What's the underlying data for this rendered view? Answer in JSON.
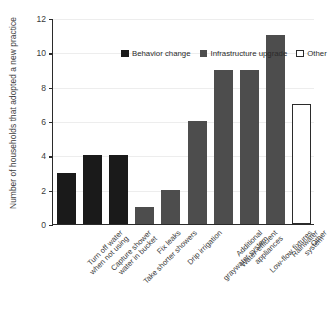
{
  "chart_data": {
    "type": "bar",
    "title": "",
    "xlabel": "",
    "ylabel": "Number of households that\nadopted a new practice",
    "ylim": [
      0,
      12
    ],
    "yticks": [
      0,
      2,
      4,
      6,
      8,
      10,
      12
    ],
    "grid": true,
    "legend_position": "upper left (inside axes)",
    "categories": [
      "Turn off water\nwhen not using",
      "Capture shower\nwater in bucket",
      "Take shorter showers",
      "Fix leaks",
      "Drip irrigation",
      "Additional\ngraywater system",
      "Water-efficient\nappliances",
      "Low-flow fixtures",
      "Rainwater system",
      "Other"
    ],
    "values": [
      3,
      4,
      4,
      1,
      2,
      6,
      9,
      9,
      11,
      7
    ],
    "groups": [
      "Behavior change",
      "Behavior change",
      "Behavior change",
      "Infrastructure upgrade",
      "Infrastructure upgrade",
      "Infrastructure upgrade",
      "Infrastructure upgrade",
      "Infrastructure upgrade",
      "Infrastructure upgrade",
      "Other"
    ],
    "legend": [
      {
        "label": "Behavior change",
        "color": "#1a1a1a",
        "edge": "#1a1a1a"
      },
      {
        "label": "Infrastructure upgrade",
        "color": "#4d4d4d",
        "edge": "#4d4d4d"
      },
      {
        "label": "Other",
        "color": "#ffffff",
        "edge": "#2b2b2b"
      }
    ]
  },
  "axis": {
    "ytick_labels": [
      "0",
      "2",
      "4",
      "6",
      "8",
      "10",
      "12"
    ]
  }
}
